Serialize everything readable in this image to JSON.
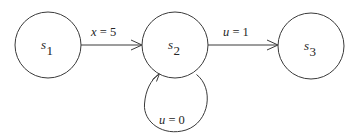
{
  "diagram": {
    "type": "state-transition-graph",
    "background_color": "#ffffff",
    "stroke_color": "#3a3a3a",
    "text_color": "#262626",
    "nodes": [
      {
        "id": "s1",
        "label_base": "s",
        "label_sub": "1",
        "cx": 48,
        "cy": 45,
        "r": 33
      },
      {
        "id": "s2",
        "label_base": "s",
        "label_sub": "2",
        "cx": 175,
        "cy": 45,
        "r": 33
      },
      {
        "id": "s3",
        "label_base": "s",
        "label_sub": "3",
        "cx": 311,
        "cy": 46,
        "r": 33
      }
    ],
    "edges": [
      {
        "id": "e1",
        "from": "s1",
        "to": "s2",
        "label_var": "x",
        "label_op": "=",
        "label_num": "5",
        "label_text": "x = 5",
        "label_x": 110,
        "label_y": 33
      },
      {
        "id": "e2",
        "from": "s2",
        "to": "s3",
        "label_var": "u",
        "label_op": "=",
        "label_num": "1",
        "label_text": "u = 1",
        "label_x": 242,
        "label_y": 33
      },
      {
        "id": "e3",
        "from": "s2",
        "to": "s2",
        "self_loop": true,
        "label_var": "u",
        "label_op": "=",
        "label_num": "0",
        "label_text": "u = 0",
        "label_x": 178,
        "label_y": 121
      }
    ]
  }
}
